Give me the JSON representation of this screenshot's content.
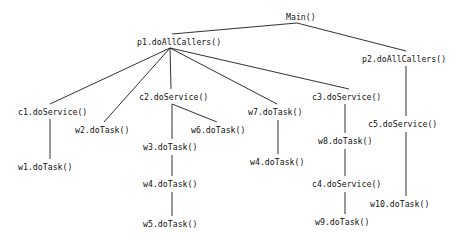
{
  "diagram": {
    "type": "call-tree",
    "background_color": "#ffffff",
    "line_color": "#1b1b1b",
    "text_color": "#111111",
    "nodes": [
      {
        "id": "main",
        "label": "Main()",
        "x": 285,
        "y": 13
      },
      {
        "id": "p1",
        "label": "p1.doAllCallers()",
        "x": 136,
        "y": 38
      },
      {
        "id": "p2",
        "label": "p2.doAllCallers()",
        "x": 361,
        "y": 55
      },
      {
        "id": "c1",
        "label": "c1.doService()",
        "x": 17,
        "y": 108
      },
      {
        "id": "w2",
        "label": "w2.doTask()",
        "x": 74,
        "y": 126
      },
      {
        "id": "c2",
        "label": "c2.doService()",
        "x": 138,
        "y": 93
      },
      {
        "id": "w6",
        "label": "w6.doTask()",
        "x": 190,
        "y": 126
      },
      {
        "id": "w3",
        "label": "w3.doTask()",
        "x": 142,
        "y": 143
      },
      {
        "id": "w7",
        "label": "w7.doTask()",
        "x": 247,
        "y": 108
      },
      {
        "id": "c3",
        "label": "c3.doService()",
        "x": 311,
        "y": 93
      },
      {
        "id": "c5",
        "label": "c5.doService()",
        "x": 367,
        "y": 120
      },
      {
        "id": "w8",
        "label": "w8.doTask()",
        "x": 317,
        "y": 137
      },
      {
        "id": "w1",
        "label": "w1.doTask()",
        "x": 17,
        "y": 163
      },
      {
        "id": "w4b",
        "label": "w4.doTask()",
        "x": 249,
        "y": 158
      },
      {
        "id": "w4a",
        "label": "w4.doTask()",
        "x": 142,
        "y": 180
      },
      {
        "id": "c4",
        "label": "c4.doService()",
        "x": 311,
        "y": 180
      },
      {
        "id": "w10",
        "label": "w10.doTask()",
        "x": 369,
        "y": 200
      },
      {
        "id": "w5",
        "label": "w5.doTask()",
        "x": 142,
        "y": 220
      },
      {
        "id": "w9",
        "label": "w9.doTask()",
        "x": 314,
        "y": 218
      }
    ],
    "edges": [
      {
        "from": "main",
        "to": "p1",
        "x1": 297,
        "y1": 23,
        "x2": 172,
        "y2": 34
      },
      {
        "from": "main",
        "to": "p2",
        "x1": 297,
        "y1": 23,
        "x2": 406,
        "y2": 51
      },
      {
        "from": "p1",
        "to": "c1",
        "x1": 170,
        "y1": 48,
        "x2": 50,
        "y2": 104
      },
      {
        "from": "p1",
        "to": "w2",
        "x1": 170,
        "y1": 48,
        "x2": 104,
        "y2": 122
      },
      {
        "from": "p1",
        "to": "c2",
        "x1": 170,
        "y1": 48,
        "x2": 171,
        "y2": 89
      },
      {
        "from": "p1",
        "to": "w7",
        "x1": 170,
        "y1": 48,
        "x2": 277,
        "y2": 104
      },
      {
        "from": "p1",
        "to": "c3",
        "x1": 170,
        "y1": 48,
        "x2": 349,
        "y2": 89
      },
      {
        "from": "p2",
        "to": "c5",
        "x1": 406,
        "y1": 66,
        "x2": 406,
        "y2": 116
      },
      {
        "from": "c1",
        "to": "w1",
        "x1": 50,
        "y1": 119,
        "x2": 50,
        "y2": 159
      },
      {
        "from": "c2",
        "to": "w3",
        "x1": 172,
        "y1": 104,
        "x2": 172,
        "y2": 139
      },
      {
        "from": "c2",
        "to": "w6",
        "x1": 172,
        "y1": 104,
        "x2": 217,
        "y2": 122
      },
      {
        "from": "w7",
        "to": "w4b",
        "x1": 278,
        "y1": 120,
        "x2": 278,
        "y2": 154
      },
      {
        "from": "c3",
        "to": "w8",
        "x1": 345,
        "y1": 104,
        "x2": 345,
        "y2": 133
      },
      {
        "from": "w3",
        "to": "w4a",
        "x1": 172,
        "y1": 155,
        "x2": 172,
        "y2": 176
      },
      {
        "from": "c5",
        "to": "w10",
        "x1": 406,
        "y1": 132,
        "x2": 406,
        "y2": 196
      },
      {
        "from": "w8",
        "to": "c4",
        "x1": 345,
        "y1": 149,
        "x2": 345,
        "y2": 176
      },
      {
        "from": "w4a",
        "to": "w5",
        "x1": 172,
        "y1": 192,
        "x2": 172,
        "y2": 216
      },
      {
        "from": "c4",
        "to": "w9",
        "x1": 345,
        "y1": 192,
        "x2": 345,
        "y2": 214
      }
    ]
  }
}
